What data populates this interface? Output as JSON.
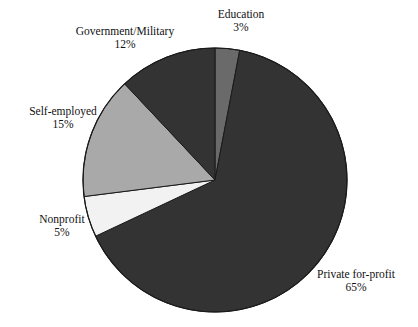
{
  "chart_data": {
    "type": "pie",
    "title": "",
    "subtitle": "",
    "xlabel": "",
    "ylabel": "",
    "legend_position": "none",
    "grid": false,
    "start_angle_deg": 0,
    "direction": "clockwise",
    "units": "percent",
    "total": 100,
    "categories": [
      "Education",
      "Private for-profit",
      "Nonprofit",
      "Self-employed",
      "Government/Military"
    ],
    "values": [
      3,
      65,
      5,
      15,
      12
    ],
    "slices": [
      {
        "label": "Education",
        "value": 3,
        "value_text": "3%",
        "color": "#6a6a6a",
        "start_deg": 0,
        "end_deg": 10.8
      },
      {
        "label": "Private for-profit",
        "value": 65,
        "value_text": "65%",
        "color": "#333333",
        "start_deg": 10.8,
        "end_deg": 244.8
      },
      {
        "label": "Nonprofit",
        "value": 5,
        "value_text": "5%",
        "color": "#f2f2f2",
        "start_deg": 244.8,
        "end_deg": 262.8
      },
      {
        "label": "Self-employed",
        "value": 15,
        "value_text": "15%",
        "color": "#a9a9a9",
        "start_deg": 262.8,
        "end_deg": 316.8
      },
      {
        "label": "Government/Military",
        "value": 12,
        "value_text": "12%",
        "color": "#333333",
        "start_deg": 316.8,
        "end_deg": 360
      }
    ],
    "geometry": {
      "center_x": 215,
      "center_y": 180,
      "radius": 132
    },
    "colors": {
      "dark": "#333333",
      "medium": "#6a6a6a",
      "light": "#a9a9a9",
      "white": "#f2f2f2",
      "outline": "#1a1a1a",
      "background": "#ffffff",
      "text": "#111111"
    }
  },
  "labels": {
    "education": {
      "name": "Education",
      "value": "3%"
    },
    "private": {
      "name": "Private for-profit",
      "value": "65%"
    },
    "nonprofit": {
      "name": "Nonprofit",
      "value": "5%"
    },
    "selfemployed": {
      "name": "Self-employed",
      "value": "15%"
    },
    "government": {
      "name": "Government/Military",
      "value": "12%"
    }
  }
}
